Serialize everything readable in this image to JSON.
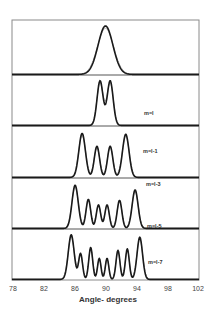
{
  "chart_data": {
    "type": "line",
    "title": "",
    "xlabel": "Angle- degrees",
    "ylabel": "",
    "xlim": [
      78,
      102
    ],
    "x_ticks": [
      78,
      82,
      86,
      90,
      94,
      98,
      102
    ],
    "grid": false,
    "legend": null,
    "layout": "5 vertically stacked panels sharing x-axis; each shows measured (dark) and fitted (light gray) intensity profiles",
    "panels": [
      {
        "label": "",
        "peaks": [
          {
            "x": 90.0,
            "height": 0.95,
            "width": 0.95
          }
        ]
      },
      {
        "label": "m=l",
        "peaks": [
          {
            "x": 89.3,
            "height": 0.95,
            "width": 0.38
          },
          {
            "x": 90.6,
            "height": 0.95,
            "width": 0.38
          }
        ]
      },
      {
        "label": "m=l-1",
        "peaks": [
          {
            "x": 87.0,
            "height": 0.92,
            "width": 0.42
          },
          {
            "x": 88.9,
            "height": 0.65,
            "width": 0.34
          },
          {
            "x": 90.6,
            "height": 0.65,
            "width": 0.34
          },
          {
            "x": 92.6,
            "height": 0.9,
            "width": 0.42
          }
        ]
      },
      {
        "label": "m=l-3",
        "peaks": [
          {
            "x": 86.1,
            "height": 0.92,
            "width": 0.4
          },
          {
            "x": 87.8,
            "height": 0.62,
            "width": 0.3
          },
          {
            "x": 89.1,
            "height": 0.5,
            "width": 0.28
          },
          {
            "x": 90.2,
            "height": 0.5,
            "width": 0.28
          },
          {
            "x": 91.8,
            "height": 0.6,
            "width": 0.3
          },
          {
            "x": 93.8,
            "height": 0.82,
            "width": 0.38
          }
        ]
      },
      {
        "label": "m=l-5",
        "peaks": []
      },
      {
        "label": "m=l-7",
        "peaks": [
          {
            "x": 85.6,
            "height": 0.95,
            "width": 0.38
          },
          {
            "x": 86.8,
            "height": 0.55,
            "width": 0.25
          },
          {
            "x": 88.1,
            "height": 0.68,
            "width": 0.25
          },
          {
            "x": 89.2,
            "height": 0.45,
            "width": 0.22
          },
          {
            "x": 90.2,
            "height": 0.45,
            "width": 0.22
          },
          {
            "x": 91.6,
            "height": 0.62,
            "width": 0.25
          },
          {
            "x": 92.8,
            "height": 0.65,
            "width": 0.25
          },
          {
            "x": 94.4,
            "height": 0.9,
            "width": 0.35
          }
        ]
      }
    ],
    "label_positions": [
      {
        "text": "m=l",
        "panel": 1
      },
      {
        "text": "m=l-1",
        "panel": 2
      },
      {
        "text": "m=l-3",
        "panel": 3
      },
      {
        "text": "m=l-5",
        "panel": 3
      },
      {
        "text": "m=l-7",
        "panel": 4
      }
    ]
  },
  "labels": {
    "m_l": "m=l",
    "m_l1": "m=l-1",
    "m_l3": "m=l-3",
    "m_l5": "m=l-5",
    "m_l7": "m=l-7",
    "xlabel": "Angle- degrees",
    "ticks": [
      "78",
      "82",
      "86",
      "90",
      "94",
      "98",
      "102"
    ]
  }
}
